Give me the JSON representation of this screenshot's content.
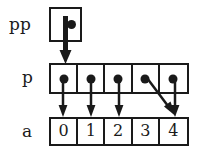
{
  "diagram": {
    "background_color": "#ffffff",
    "ink_color": "#1a1a1a",
    "rows": [
      {
        "id": "pp",
        "label": "pp",
        "kind": "single-pointer-box",
        "cells": [
          {
            "value": "",
            "marker": "dot"
          }
        ]
      },
      {
        "id": "p",
        "label": "p",
        "kind": "pointer-array",
        "cells": [
          {
            "index": 0,
            "value": "",
            "marker": "dot"
          },
          {
            "index": 1,
            "value": "",
            "marker": "dot"
          },
          {
            "index": 2,
            "value": "",
            "marker": "dot"
          },
          {
            "index": 3,
            "value": "",
            "marker": "dot"
          },
          {
            "index": 4,
            "value": "",
            "marker": "dot"
          }
        ]
      },
      {
        "id": "a",
        "label": "a",
        "kind": "value-array",
        "cells": [
          {
            "index": 0,
            "value": "0"
          },
          {
            "index": 1,
            "value": "1"
          },
          {
            "index": 2,
            "value": "2"
          },
          {
            "index": 3,
            "value": "3"
          },
          {
            "index": 4,
            "value": "4"
          }
        ]
      }
    ],
    "arrows": [
      {
        "id": "pp-to-p0",
        "from": "pp.cell0",
        "to": "p.cell0",
        "style": "thick-straight-down"
      },
      {
        "id": "p0-to-a0",
        "from": "p.cell0",
        "to": "a.cell0",
        "style": "straight-down"
      },
      {
        "id": "p1-to-a1",
        "from": "p.cell1",
        "to": "a.cell1",
        "style": "straight-down"
      },
      {
        "id": "p2-to-a2",
        "from": "p.cell2",
        "to": "a.cell2",
        "style": "straight-down"
      },
      {
        "id": "p3-to-a4",
        "from": "p.cell3",
        "to": "a.cell4",
        "style": "diagonal-down-right"
      },
      {
        "id": "p4-to-a4",
        "from": "p.cell4",
        "to": "a.cell4",
        "style": "straight-down"
      }
    ]
  }
}
